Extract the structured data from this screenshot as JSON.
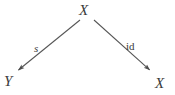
{
  "diagram": {
    "kind": "commutative-diagram",
    "background_color": "#ffffff",
    "stroke_color": "#555555",
    "text_color": "#3b3b3b",
    "width": 175,
    "height": 95,
    "nodes": [
      {
        "id": "top",
        "label": "X",
        "x": 86,
        "y": 11,
        "style": "italic"
      },
      {
        "id": "bottom_left",
        "label": "Y",
        "x": 9,
        "y": 82,
        "style": "italic"
      },
      {
        "id": "bottom_right",
        "label": "X",
        "x": 161,
        "y": 84,
        "style": "italic"
      }
    ],
    "edges": [
      {
        "id": "edge_s",
        "label": "s",
        "label_style": "italic",
        "from": "top",
        "to": "bottom_left",
        "from_point": [
          80,
          20
        ],
        "to_point": [
          16,
          72
        ],
        "arrowhead": "solid-triangle",
        "label_x": 38,
        "label_y": 49
      },
      {
        "id": "edge_id",
        "label": "id",
        "label_style": "roman",
        "from": "top",
        "to": "bottom_right",
        "from_point": [
          94,
          20
        ],
        "to_point": [
          152,
          72
        ],
        "arrowhead": "solid-triangle",
        "label_x": 132,
        "label_y": 47
      }
    ]
  }
}
